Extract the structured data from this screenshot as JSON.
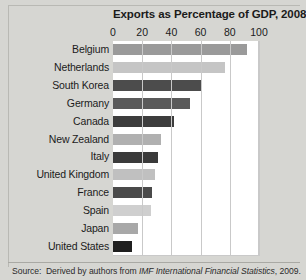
{
  "chart_data": {
    "type": "bar",
    "orientation": "horizontal",
    "title": "Exports as Percentage of GDP, 2008",
    "xlabel": "",
    "ylabel": "",
    "xlim": [
      0,
      100
    ],
    "xticks": [
      0,
      20,
      40,
      60,
      80,
      100
    ],
    "xtick_labels": [
      "0",
      "20",
      "40",
      "60",
      "80",
      "100"
    ],
    "grid": true,
    "legend": "none",
    "categories": [
      "Belgium",
      "Netherlands",
      "South Korea",
      "Germany",
      "Canada",
      "New Zealand",
      "Italy",
      "United Kingdom",
      "France",
      "Spain",
      "Japan",
      "United States"
    ],
    "values": [
      92,
      77,
      61,
      53,
      42,
      33,
      31,
      29,
      27,
      26,
      17,
      13
    ],
    "bar_colors": [
      "#9a9a9a",
      "#c5c5c5",
      "#4c4c4c",
      "#5a5a5a",
      "#3d3d3d",
      "#b0b0b0",
      "#3a3a3a",
      "#c0c0c0",
      "#4a4a4a",
      "#cfcfcf",
      "#a8a8a8",
      "#1f1f1f"
    ],
    "source_prefix": "Source:",
    "source_text": "Derived by authors from ",
    "source_italic": "IMF International Financial Statistics",
    "source_suffix": ", 2009."
  },
  "figure": {
    "background_color": "#d6d6d2",
    "plot_background_color": "#ffffff",
    "gridline_color": "#c9c9c9"
  }
}
